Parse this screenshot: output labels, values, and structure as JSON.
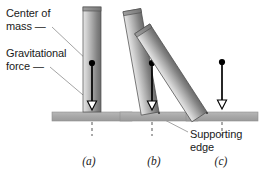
{
  "figure": {
    "background": "#ffffff"
  },
  "annotations": {
    "center_of_mass": "Center of\nmass —",
    "gravitational_force": "Gravitational\nforce —",
    "supporting_edge": "Supporting\nedge"
  },
  "captions": {
    "a": "(a)",
    "b": "(b)",
    "c": "(c)"
  },
  "colors": {
    "block_light": "#dcdcdc",
    "block_mid": "#b4b4b4",
    "block_dark": "#6e6e6e",
    "block_outline": "#4d4d4d",
    "ground": "#aaaaaa",
    "ground_outline": "#8e8e8e",
    "arrow": "#000000",
    "arrowhead_fill": "#ffffff",
    "dot": "#000000",
    "dashed_line": "#555555",
    "leader_line": "#9a9a9a",
    "text": "#1a1a1a"
  },
  "panels": [
    {
      "id": "a",
      "tilt_degrees": 0,
      "block_width": 18,
      "block_height": 105,
      "pivot_x": 92,
      "ground_y": 116,
      "com_x": 92,
      "com_y": 63,
      "arrow_tip_y": 108,
      "dashed_from_y": 116,
      "dashed_to_y": 134,
      "ground_x_start": 52,
      "ground_x_end": 132
    },
    {
      "id": "b",
      "tilt_degrees": 10,
      "block_width": 18,
      "block_height": 105,
      "pivot_x": 157,
      "ground_y": 116,
      "com_x": 153,
      "com_y": 63,
      "arrow_tip_y": 108,
      "dashed_from_y": 116,
      "dashed_to_y": 134,
      "ground_x_start": 120,
      "ground_x_end": 197
    },
    {
      "id": "c",
      "tilt_degrees": 32,
      "block_width": 18,
      "block_height": 105,
      "pivot_x": 214,
      "ground_y": 116,
      "com_x": 222,
      "com_y": 62,
      "arrow_tip_y": 108,
      "dashed_from_y": 116,
      "dashed_to_y": 134,
      "ground_x_start": 186,
      "ground_x_end": 258
    }
  ],
  "leaders": {
    "center_of_mass": {
      "x1": 52,
      "y1": 27,
      "x2": 88,
      "y2": 61
    },
    "gravitational_force": {
      "x1": 50,
      "y1": 67,
      "x2": 89,
      "y2": 99
    },
    "supporting_edge": {
      "x1": 188,
      "y1": 132,
      "x2": 159,
      "y2": 117
    }
  }
}
